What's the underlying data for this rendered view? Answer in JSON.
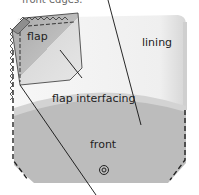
{
  "caption": {
    "text": "front edges."
  },
  "labels": {
    "flap": "flap",
    "lining": "lining",
    "flap_interfacing": "flap interfacing",
    "front": "front"
  },
  "colors": {
    "lining": "#f3f3f3",
    "front": "#bdbdbd",
    "flap_dark": "#a9a9a9",
    "flap_light": "#d8d8d8",
    "outline": "#222222",
    "background": "#ffffff"
  },
  "icons": {
    "snap": "snap-fastener-icon"
  }
}
